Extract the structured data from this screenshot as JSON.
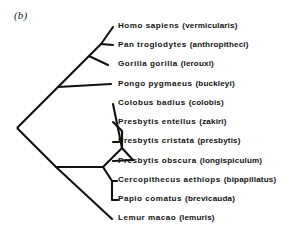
{
  "figure": {
    "panel_label": "(b)",
    "type": "cladogram",
    "ink_color": "#111111",
    "background_color": "#ffffff"
  },
  "taxa": [
    {
      "host": "Homo sapiens",
      "parasite": "(vermicularis)",
      "tip_y": 26
    },
    {
      "host": "Pan troglodytes",
      "parasite": "(anthropitheci)",
      "tip_y": 45
    },
    {
      "host": "Gorilla gorilla",
      "parasite": "(lerouxi)",
      "tip_y": 64
    },
    {
      "host": "Pongo pygmaeus",
      "parasite": "(buckleyi)",
      "tip_y": 84
    },
    {
      "host": "Colobus badius",
      "parasite": "(colobis)",
      "tip_y": 103
    },
    {
      "host": "Presbytis entellus",
      "parasite": "(zakiri)",
      "tip_y": 122
    },
    {
      "host": "Presbytis cristata",
      "parasite": "(presbytis)",
      "tip_y": 141
    },
    {
      "host": "Presbytis obscura",
      "parasite": "(longispiculum)",
      "tip_y": 161
    },
    {
      "host": "Cercopithecus aethiops",
      "parasite": "(bipapillatus)",
      "tip_y": 180
    },
    {
      "host": "Papio comatus",
      "parasite": "(brevicauda)",
      "tip_y": 199
    },
    {
      "host": "Lemur macao",
      "parasite": "(lemuris)",
      "tip_y": 218
    }
  ]
}
